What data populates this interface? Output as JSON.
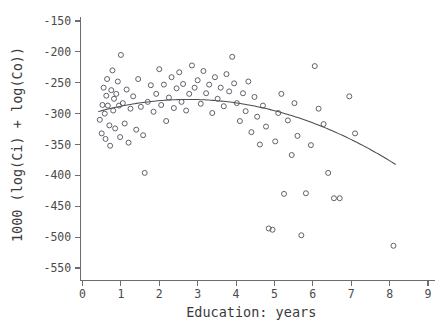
{
  "chart_data": {
    "type": "scatter",
    "title": "",
    "xlabel": "Education: years",
    "ylabel": "1000 (log(Ci) + log(Co))",
    "xlim": [
      0,
      9
    ],
    "ylim": [
      -570,
      -140
    ],
    "xticks": [
      0,
      1,
      2,
      3,
      4,
      5,
      6,
      7,
      8,
      9
    ],
    "xticklabels": [
      "0",
      "1",
      "2",
      "3",
      "4",
      "5",
      "6",
      "7",
      "8",
      "9"
    ],
    "yticks": [
      -150,
      -200,
      -250,
      -300,
      -350,
      -400,
      -450,
      -500,
      -550
    ],
    "yticklabels": [
      "-150",
      "-200",
      "-250",
      "-300",
      "-350",
      "-400",
      "-450",
      "-500",
      "-550"
    ],
    "grid": false,
    "legend": null,
    "marker": "open-circle",
    "marker_color": "#555a63",
    "curve_color": "#4d4d4d",
    "axis_color": "#6d6d6d",
    "background": "#ffffff",
    "points": [
      [
        0.45,
        -310
      ],
      [
        0.5,
        -332
      ],
      [
        0.52,
        -286
      ],
      [
        0.55,
        -258
      ],
      [
        0.58,
        -300
      ],
      [
        0.6,
        -341
      ],
      [
        0.62,
        -271
      ],
      [
        0.64,
        -244
      ],
      [
        0.66,
        -287
      ],
      [
        0.7,
        -319
      ],
      [
        0.72,
        -352
      ],
      [
        0.75,
        -262
      ],
      [
        0.78,
        -230
      ],
      [
        0.8,
        -295
      ],
      [
        0.82,
        -276
      ],
      [
        0.85,
        -324
      ],
      [
        0.88,
        -268
      ],
      [
        0.92,
        -248
      ],
      [
        0.95,
        -287
      ],
      [
        0.98,
        -338
      ],
      [
        1.0,
        -205
      ],
      [
        1.05,
        -283
      ],
      [
        1.1,
        -316
      ],
      [
        1.15,
        -261
      ],
      [
        1.2,
        -347
      ],
      [
        1.25,
        -292
      ],
      [
        1.32,
        -272
      ],
      [
        1.4,
        -326
      ],
      [
        1.45,
        -244
      ],
      [
        1.52,
        -289
      ],
      [
        1.58,
        -335
      ],
      [
        1.62,
        -396
      ],
      [
        1.7,
        -281
      ],
      [
        1.78,
        -254
      ],
      [
        1.85,
        -297
      ],
      [
        1.92,
        -268
      ],
      [
        2.0,
        -228
      ],
      [
        2.05,
        -286
      ],
      [
        2.12,
        -253
      ],
      [
        2.18,
        -312
      ],
      [
        2.25,
        -274
      ],
      [
        2.32,
        -241
      ],
      [
        2.38,
        -291
      ],
      [
        2.45,
        -259
      ],
      [
        2.52,
        -233
      ],
      [
        2.58,
        -281
      ],
      [
        2.62,
        -252
      ],
      [
        2.7,
        -295
      ],
      [
        2.78,
        -268
      ],
      [
        2.85,
        -222
      ],
      [
        2.92,
        -258
      ],
      [
        3.0,
        -246
      ],
      [
        3.08,
        -284
      ],
      [
        3.15,
        -231
      ],
      [
        3.22,
        -267
      ],
      [
        3.3,
        -253
      ],
      [
        3.38,
        -299
      ],
      [
        3.45,
        -241
      ],
      [
        3.52,
        -276
      ],
      [
        3.6,
        -258
      ],
      [
        3.68,
        -288
      ],
      [
        3.75,
        -236
      ],
      [
        3.82,
        -264
      ],
      [
        3.9,
        -208
      ],
      [
        3.95,
        -251
      ],
      [
        4.02,
        -283
      ],
      [
        4.1,
        -312
      ],
      [
        4.18,
        -267
      ],
      [
        4.25,
        -296
      ],
      [
        4.32,
        -248
      ],
      [
        4.4,
        -330
      ],
      [
        4.48,
        -273
      ],
      [
        4.55,
        -305
      ],
      [
        4.62,
        -350
      ],
      [
        4.7,
        -287
      ],
      [
        4.78,
        -321
      ],
      [
        4.85,
        -486
      ],
      [
        4.95,
        -488
      ],
      [
        5.02,
        -345
      ],
      [
        5.1,
        -299
      ],
      [
        5.18,
        -268
      ],
      [
        5.25,
        -430
      ],
      [
        5.35,
        -311
      ],
      [
        5.45,
        -367
      ],
      [
        5.52,
        -283
      ],
      [
        5.6,
        -336
      ],
      [
        5.7,
        -497
      ],
      [
        5.82,
        -429
      ],
      [
        5.95,
        -351
      ],
      [
        6.05,
        -223
      ],
      [
        6.15,
        -292
      ],
      [
        6.28,
        -317
      ],
      [
        6.4,
        -396
      ],
      [
        6.55,
        -437
      ],
      [
        6.7,
        -437
      ],
      [
        6.95,
        -272
      ],
      [
        7.1,
        -332
      ],
      [
        8.1,
        -514
      ]
    ],
    "fit_curve": {
      "kind": "quadratic-smoother",
      "x_start": 0.42,
      "x_end": 8.15,
      "vertex_x": 2.75,
      "vertex_y": -277,
      "curvature": -3.6
    }
  }
}
